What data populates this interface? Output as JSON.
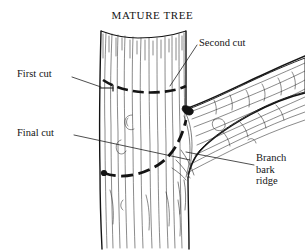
{
  "figure": {
    "title": "MATURE TREE",
    "background_color": "#ffffff",
    "ink_color": "#141414",
    "width": 305,
    "height": 251
  },
  "labels": {
    "first_cut": "First cut",
    "second_cut": "Second cut",
    "final_cut": "Final cut",
    "branch_bark_ridge_line1": "Branch",
    "branch_bark_ridge_line2": "bark",
    "branch_bark_ridge_line3": "ridge"
  },
  "diagram": {
    "trunk_label": "tree-trunk",
    "branch_label": "side-branch",
    "cuts": [
      {
        "name": "first-cut",
        "style": "notch",
        "description": "short undercut notch on left side of trunk"
      },
      {
        "name": "second-cut",
        "style": "dashed",
        "description": "dashed arc across upper trunk"
      },
      {
        "name": "final-cut",
        "style": "dashed",
        "description": "dashed curved arc at branch collar"
      }
    ]
  }
}
